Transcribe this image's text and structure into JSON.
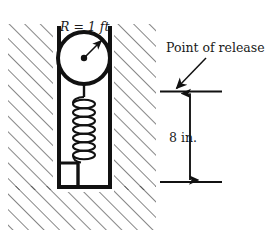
{
  "figure": {
    "background_color": "#ffffff",
    "ink_color": "#111111",
    "hatch_color": "#2b2b2b"
  },
  "labels": {
    "radius": {
      "symbol": "R",
      "equals": "=",
      "value": "1 ft",
      "full": "R = 1 ft",
      "x": 60,
      "y": 31
    },
    "point_of_release": {
      "text": "Point of release",
      "x": 166,
      "y": 52
    },
    "dimension": {
      "text": "8 in.",
      "value": 8,
      "unit": "in.",
      "x": 169,
      "y": 142
    }
  },
  "geometry": {
    "channel": {
      "left_wall_x": 57,
      "right_wall_x": 110,
      "top_y": 26,
      "bottom_y": 188,
      "wall_thickness": 4
    },
    "pulley": {
      "center_x": 84,
      "center_y": 58,
      "radius": 26,
      "rim_thickness": 4,
      "hub_radius": 3.2,
      "radius_arrow_angle_deg": 48
    },
    "spring": {
      "top_y": 97,
      "bottom_y": 163,
      "center_x": 84,
      "coil_count": 7,
      "coil_width": 22
    },
    "dimension_line": {
      "x": 190,
      "top_y": 92,
      "bottom_y": 182,
      "tick_left_x": 160,
      "tick_right_x": 222
    },
    "release_arrow": {
      "from_x": 206,
      "from_y": 58,
      "to_x": 176,
      "to_y": 89
    }
  },
  "icons": {
    "hatch": "diagonal-hatch-icon",
    "pulley": "pulley-icon",
    "spring": "spring-coil-icon",
    "arrow_up": "arrow-up-icon",
    "arrow_down": "arrow-down-icon",
    "pointer": "pointer-arrow-icon"
  }
}
